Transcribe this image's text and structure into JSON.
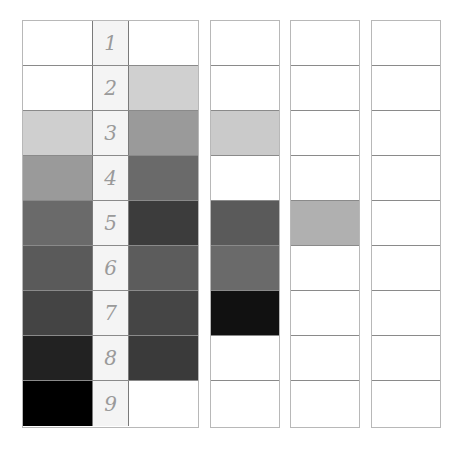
{
  "labels": [
    "1",
    "2",
    "3",
    "4",
    "5",
    "6",
    "7",
    "8",
    "9"
  ],
  "main_grid": {
    "column_a": [
      "#ffffff",
      "#ffffff",
      "#cfcfcf",
      "#9a9a9a",
      "#6a6a6a",
      "#5a5a5a",
      "#444444",
      "#222222",
      "#000000"
    ],
    "column_b": [
      "#ffffff",
      "#d0d0d0",
      "#9a9a9a",
      "#6a6a6a",
      "#3c3c3c",
      "#5c5c5c",
      "#454545",
      "#3a3a3a",
      "#ffffff"
    ]
  },
  "columns": [
    {
      "name": "column-2",
      "cells": [
        "#ffffff",
        "#ffffff",
        "#cacaca",
        "#ffffff",
        "#5a5a5a",
        "#6a6a6a",
        "#111111",
        "#ffffff",
        "#ffffff"
      ]
    },
    {
      "name": "column-3",
      "cells": [
        "#ffffff",
        "#ffffff",
        "#ffffff",
        "#ffffff",
        "#b0b0b0",
        "#ffffff",
        "#ffffff",
        "#ffffff",
        "#ffffff"
      ]
    },
    {
      "name": "column-4",
      "cells": [
        "#ffffff",
        "#ffffff",
        "#ffffff",
        "#ffffff",
        "#ffffff",
        "#ffffff",
        "#ffffff",
        "#ffffff",
        "#ffffff"
      ]
    }
  ]
}
